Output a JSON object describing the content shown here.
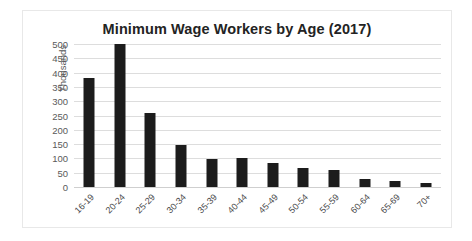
{
  "chart_data": {
    "type": "bar",
    "title": "Minimum Wage Workers by Age (2017)",
    "xlabel": "",
    "ylabel": "Thousands",
    "categories": [
      "16-19",
      "20-24",
      "25-29",
      "30-34",
      "35-39",
      "40-44",
      "45-49",
      "50-54",
      "55-59",
      "60-64",
      "65-69",
      "70+"
    ],
    "values": [
      380,
      500,
      260,
      148,
      98,
      100,
      85,
      65,
      60,
      28,
      22,
      15
    ],
    "ylim": [
      0,
      500
    ],
    "yticks": [
      0,
      50,
      100,
      150,
      200,
      250,
      300,
      350,
      400,
      450,
      500
    ],
    "ytick_labels": [
      "0",
      "50",
      "100",
      "150",
      "200",
      "250",
      "300",
      "350",
      "400",
      "450",
      "500"
    ],
    "grid": true,
    "legend": false,
    "bar_color": "#1c1c1c",
    "grid_color": "#dddddd",
    "title_color": "#232323"
  }
}
